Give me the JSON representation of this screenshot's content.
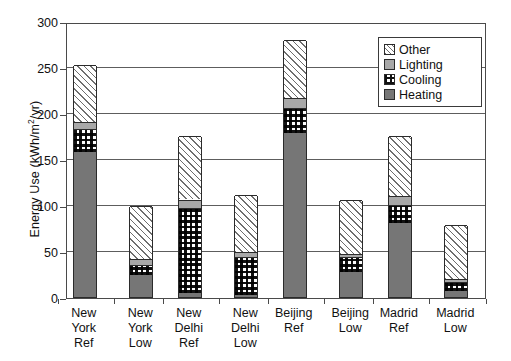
{
  "chart_data": {
    "type": "bar",
    "stacked": true,
    "title": "",
    "xlabel": "",
    "ylabel": "Energy Use (kWh/m2/yr)",
    "ylabel_parts": {
      "pre": "Energy Use (kWh/m",
      "sup": "2",
      "post": "/yr)"
    },
    "ylim": [
      0,
      300
    ],
    "yticks": [
      0,
      50,
      100,
      150,
      200,
      250,
      300
    ],
    "ytick_labels": [
      "0",
      "50",
      "100",
      "150",
      "200",
      "250",
      "300"
    ],
    "grid": true,
    "grid_axis": "y",
    "legend_position": "top-right",
    "categories": [
      "New York Ref",
      "New York Low",
      "New Delhi Ref",
      "New Delhi Low",
      "Beijing Ref",
      "Beijing Low",
      "Madrid Ref",
      "Madrid Low"
    ],
    "category_label_lines": [
      [
        "New",
        "York",
        "Ref"
      ],
      [
        "New",
        "York",
        "Low"
      ],
      [
        "New",
        "Delhi",
        "Ref"
      ],
      [
        "New",
        "Delhi",
        "Low"
      ],
      [
        "Beijing",
        "Ref",
        ""
      ],
      [
        "Beijing",
        "Low",
        ""
      ],
      [
        "Madrid",
        "Ref",
        ""
      ],
      [
        "Madrid",
        "Low",
        ""
      ]
    ],
    "series": [
      {
        "name": "Heating",
        "values": [
          158,
          24,
          4,
          2,
          178,
          27,
          80,
          7
        ]
      },
      {
        "name": "Cooling",
        "values": [
          25,
          11,
          93,
          41,
          27,
          16,
          20,
          9
        ]
      },
      {
        "name": "Lighting",
        "values": [
          7,
          6,
          9,
          6,
          11,
          4,
          10,
          4
        ]
      },
      {
        "name": "Other",
        "values": [
          62,
          58,
          69,
          62,
          63,
          58,
          65,
          58
        ]
      }
    ],
    "totals": [
      252,
      99,
      175,
      111,
      279,
      105,
      175,
      78
    ],
    "stack_order_bottom_to_top": [
      "Heating",
      "Cooling",
      "Lighting",
      "Other"
    ],
    "colors": {
      "Heating": "#767676",
      "Cooling": "#ffffff",
      "Lighting": "#a8a8a8",
      "Other": "#ffffff",
      "axis": "#4a4a4a",
      "grid": "#5d5d5d",
      "bar_outline": "#2b2b2b"
    },
    "patterns": {
      "Heating": "solid-dark-gray",
      "Cooling": "checkerboard",
      "Lighting": "solid-light-gray",
      "Other": "diagonal-hatch"
    }
  },
  "legend": {
    "items": [
      {
        "label": "Other",
        "key": "other"
      },
      {
        "label": "Lighting",
        "key": "lighting"
      },
      {
        "label": "Cooling",
        "key": "cooling"
      },
      {
        "label": "Heating",
        "key": "heating"
      }
    ]
  }
}
